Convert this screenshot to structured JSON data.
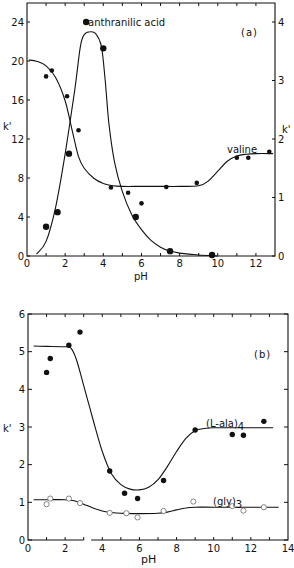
{
  "chart_data": [
    {
      "panel": "(a)",
      "type": "line",
      "xlabel": "pH",
      "ylabel_left": "k'",
      "ylabel_right": "k'",
      "xlim": [
        0,
        13
      ],
      "ylim_left": [
        0,
        26
      ],
      "ylim_right": [
        0,
        4.33
      ],
      "x_ticks": [
        0,
        2,
        4,
        6,
        8,
        10,
        12
      ],
      "x_tick_labels": [
        "0",
        "2",
        "4",
        "6",
        "8",
        "10",
        "12"
      ],
      "y_left_ticks": [
        0,
        4,
        8,
        12,
        16,
        20,
        24
      ],
      "y_left_tick_labels": [
        "0",
        "4",
        "8",
        "12",
        "16",
        "20",
        "24"
      ],
      "y_right_ticks": [
        0,
        1,
        2,
        3,
        4
      ],
      "y_right_tick_labels": [
        "0",
        "1",
        "2",
        "3",
        "4"
      ],
      "grid": false,
      "series": [
        {
          "name": "anthranilic acid",
          "axis": "left",
          "marker": "filled-large",
          "points": [
            [
              1.0,
              3.0
            ],
            [
              1.6,
              4.5
            ],
            [
              2.2,
              10.5
            ],
            [
              3.1,
              24.0
            ],
            [
              4.0,
              21.3
            ],
            [
              5.7,
              4.0
            ],
            [
              7.5,
              0.5
            ],
            [
              9.7,
              0.1
            ]
          ],
          "curve": [
            [
              0.5,
              0.2
            ],
            [
              1.0,
              1.5
            ],
            [
              1.5,
              5.0
            ],
            [
              2.0,
              10.5
            ],
            [
              2.5,
              17.0
            ],
            [
              2.8,
              21.5
            ],
            [
              3.0,
              22.7
            ],
            [
              3.3,
              23.0
            ],
            [
              3.6,
              22.8
            ],
            [
              3.9,
              21.5
            ],
            [
              4.1,
              18.0
            ],
            [
              4.3,
              13.5
            ],
            [
              4.6,
              9.5
            ],
            [
              5.0,
              6.6
            ],
            [
              5.5,
              4.2
            ],
            [
              6.0,
              2.7
            ],
            [
              6.5,
              1.6
            ],
            [
              7.0,
              0.9
            ],
            [
              7.5,
              0.5
            ],
            [
              8.0,
              0.3
            ],
            [
              9.0,
              0.1
            ],
            [
              10.0,
              0.0
            ]
          ]
        },
        {
          "name": "valine",
          "axis": "right",
          "marker": "filled-small",
          "points": [
            [
              1.0,
              3.07
            ],
            [
              1.3,
              3.17
            ],
            [
              2.1,
              2.73
            ],
            [
              2.7,
              2.15
            ],
            [
              4.4,
              1.17
            ],
            [
              5.3,
              1.08
            ],
            [
              6.0,
              0.9
            ],
            [
              7.3,
              1.18
            ],
            [
              8.9,
              1.25
            ],
            [
              11.0,
              1.68
            ],
            [
              11.6,
              1.68
            ],
            [
              12.7,
              1.78
            ]
          ],
          "curve": [
            [
              0.1,
              3.35
            ],
            [
              0.5,
              3.33
            ],
            [
              1.0,
              3.25
            ],
            [
              1.5,
              3.05
            ],
            [
              2.0,
              2.65
            ],
            [
              2.4,
              2.1
            ],
            [
              2.7,
              1.7
            ],
            [
              3.0,
              1.5
            ],
            [
              3.5,
              1.33
            ],
            [
              4.0,
              1.24
            ],
            [
              4.5,
              1.2
            ],
            [
              5.0,
              1.19
            ],
            [
              6.0,
              1.19
            ],
            [
              7.0,
              1.19
            ],
            [
              8.0,
              1.19
            ],
            [
              9.0,
              1.2
            ],
            [
              9.5,
              1.28
            ],
            [
              10.0,
              1.45
            ],
            [
              10.5,
              1.62
            ],
            [
              11.0,
              1.71
            ],
            [
              11.5,
              1.74
            ],
            [
              12.0,
              1.75
            ],
            [
              12.9,
              1.75
            ]
          ]
        }
      ],
      "annotations": [
        "anthranilic acid",
        "valine",
        "(a)"
      ]
    },
    {
      "panel": "(b)",
      "type": "line",
      "xlabel": "pH",
      "ylabel": "k'",
      "xlim": [
        0,
        14
      ],
      "ylim": [
        0,
        6
      ],
      "x_ticks": [
        0,
        2,
        4,
        6,
        8,
        10,
        12,
        14
      ],
      "x_tick_labels": [
        "0",
        "2",
        "4",
        "6",
        "8",
        "10",
        "12",
        "14"
      ],
      "y_ticks": [
        0,
        1,
        2,
        3,
        4,
        5,
        6
      ],
      "y_tick_labels": [
        "0",
        "1",
        "2",
        "3",
        "4",
        "5",
        "6"
      ],
      "grid": false,
      "series": [
        {
          "name": "(L-ala)4",
          "marker": "filled",
          "points": [
            [
              1.0,
              4.45
            ],
            [
              1.2,
              4.82
            ],
            [
              2.2,
              5.17
            ],
            [
              2.8,
              5.52
            ],
            [
              4.4,
              1.83
            ],
            [
              5.2,
              1.24
            ],
            [
              5.9,
              1.1
            ],
            [
              7.3,
              1.58
            ],
            [
              9.0,
              2.92
            ],
            [
              11.0,
              2.8
            ],
            [
              11.6,
              2.78
            ],
            [
              12.7,
              3.15
            ]
          ],
          "curve": [
            [
              0.3,
              5.15
            ],
            [
              1.0,
              5.14
            ],
            [
              2.0,
              5.13
            ],
            [
              2.3,
              5.1
            ],
            [
              2.6,
              4.8
            ],
            [
              3.0,
              4.1
            ],
            [
              3.5,
              3.2
            ],
            [
              4.0,
              2.35
            ],
            [
              4.5,
              1.75
            ],
            [
              5.0,
              1.47
            ],
            [
              5.5,
              1.35
            ],
            [
              6.0,
              1.33
            ],
            [
              6.5,
              1.4
            ],
            [
              7.0,
              1.6
            ],
            [
              7.5,
              1.95
            ],
            [
              8.0,
              2.35
            ],
            [
              8.5,
              2.7
            ],
            [
              9.0,
              2.9
            ],
            [
              9.5,
              2.96
            ],
            [
              10.0,
              2.98
            ],
            [
              11.0,
              2.98
            ],
            [
              13.2,
              2.98
            ]
          ]
        },
        {
          "name": "(gly)3",
          "marker": "open",
          "points": [
            [
              1.0,
              0.95
            ],
            [
              1.2,
              1.1
            ],
            [
              2.2,
              1.1
            ],
            [
              2.8,
              0.98
            ],
            [
              4.4,
              0.72
            ],
            [
              5.3,
              0.71
            ],
            [
              5.9,
              0.6
            ],
            [
              7.3,
              0.77
            ],
            [
              8.9,
              1.02
            ],
            [
              11.0,
              0.9
            ],
            [
              11.6,
              0.78
            ],
            [
              12.7,
              0.87
            ]
          ],
          "curve": [
            [
              0.3,
              1.07
            ],
            [
              1.0,
              1.07
            ],
            [
              2.0,
              1.07
            ],
            [
              2.5,
              1.04
            ],
            [
              3.0,
              0.95
            ],
            [
              3.5,
              0.85
            ],
            [
              4.0,
              0.77
            ],
            [
              4.5,
              0.73
            ],
            [
              5.0,
              0.71
            ],
            [
              6.0,
              0.7
            ],
            [
              7.0,
              0.71
            ],
            [
              7.5,
              0.74
            ],
            [
              8.0,
              0.8
            ],
            [
              8.5,
              0.85
            ],
            [
              9.0,
              0.87
            ],
            [
              10.0,
              0.87
            ],
            [
              12.0,
              0.87
            ],
            [
              13.5,
              0.87
            ]
          ]
        }
      ],
      "annotations": [
        "(L-ala)4",
        "(gly)3",
        "(b)"
      ]
    }
  ],
  "labels": {
    "a_panel": "(a)",
    "a_anthranilic": "anthranilic acid",
    "a_valine": "valine",
    "a_xlabel": "pH",
    "a_ylabel_left": "k'",
    "a_ylabel_right": "k'",
    "b_panel": "(b)",
    "b_ala": "(L-ala)",
    "b_ala_sub": "4",
    "b_gly": "(gly)",
    "b_gly_sub": "3",
    "b_xlabel": "pH",
    "b_ylabel": "k'"
  }
}
